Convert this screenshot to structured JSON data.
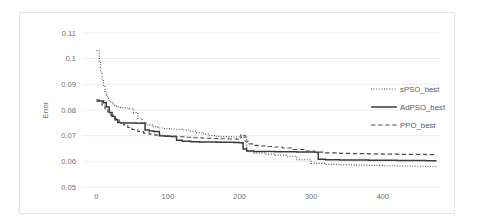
{
  "chart_data": {
    "type": "line",
    "title": "",
    "xlabel": "",
    "ylabel": "Error",
    "xlim": [
      -20,
      480
    ],
    "ylim": [
      0.05,
      0.11
    ],
    "xticks": [
      0,
      100,
      200,
      300,
      400
    ],
    "yticks": [
      0.05,
      0.06,
      0.07,
      0.08,
      0.09,
      0.1,
      0.11
    ],
    "ytick_labels": [
      "0.05",
      "0.06",
      "0.07",
      "0.08",
      "0.09",
      "0.1",
      "0.11"
    ],
    "xtick_labels": [
      "0",
      "100",
      "200",
      "300",
      "400"
    ],
    "grid": true,
    "grid_axis": "y",
    "legend_position": "right",
    "series": [
      {
        "name": "sPSO_best",
        "style": "dotted",
        "color": "#5d5d5d",
        "x": [
          0,
          2,
          4,
          6,
          8,
          10,
          12,
          14,
          16,
          18,
          20,
          24,
          28,
          32,
          36,
          40,
          46,
          52,
          58,
          64,
          70,
          78,
          86,
          94,
          102,
          110,
          120,
          130,
          140,
          150,
          158,
          165,
          172,
          180,
          190,
          200,
          210,
          220,
          235,
          250,
          265,
          280,
          300,
          320,
          340,
          360,
          380,
          400,
          420,
          440,
          460,
          475
        ],
        "y": [
          0.1032,
          0.1032,
          0.0985,
          0.0948,
          0.0915,
          0.0893,
          0.0872,
          0.0858,
          0.0845,
          0.0836,
          0.0829,
          0.0818,
          0.0812,
          0.081,
          0.0809,
          0.0808,
          0.0805,
          0.079,
          0.0768,
          0.0752,
          0.0742,
          0.0735,
          0.073,
          0.0728,
          0.0726,
          0.0725,
          0.0722,
          0.0718,
          0.0712,
          0.0706,
          0.07,
          0.0697,
          0.0696,
          0.0696,
          0.0695,
          0.0694,
          0.0638,
          0.0632,
          0.0628,
          0.0624,
          0.062,
          0.0606,
          0.0592,
          0.0588,
          0.0586,
          0.0585,
          0.0584,
          0.0583,
          0.0582,
          0.0581,
          0.058,
          0.058
        ]
      },
      {
        "name": "AdPSO_best",
        "style": "solid",
        "color": "#3a3a3a",
        "x": [
          0,
          5,
          10,
          14,
          18,
          22,
          26,
          30,
          34,
          38,
          42,
          46,
          50,
          56,
          62,
          68,
          74,
          80,
          88,
          96,
          104,
          112,
          120,
          132,
          144,
          156,
          168,
          180,
          192,
          200,
          205,
          210,
          220,
          235,
          250,
          265,
          280,
          295,
          305,
          310,
          320,
          340,
          360,
          380,
          400,
          420,
          440,
          460,
          475
        ],
        "y": [
          0.0835,
          0.0835,
          0.0828,
          0.0812,
          0.079,
          0.0775,
          0.0762,
          0.0751,
          0.0749,
          0.0749,
          0.0749,
          0.0749,
          0.0749,
          0.0748,
          0.0748,
          0.0722,
          0.0718,
          0.0716,
          0.07,
          0.0698,
          0.0697,
          0.0682,
          0.0678,
          0.0676,
          0.0675,
          0.0675,
          0.0674,
          0.0674,
          0.0673,
          0.0672,
          0.0648,
          0.064,
          0.0638,
          0.0638,
          0.0637,
          0.0637,
          0.0636,
          0.0636,
          0.0635,
          0.0608,
          0.0606,
          0.0605,
          0.0605,
          0.0604,
          0.0604,
          0.0603,
          0.0603,
          0.0602,
          0.0602
        ]
      },
      {
        "name": "PPO_best",
        "style": "dashed",
        "color": "#4f4f4f",
        "x": [
          0,
          4,
          8,
          12,
          16,
          20,
          26,
          32,
          38,
          44,
          50,
          58,
          66,
          74,
          82,
          90,
          100,
          112,
          124,
          136,
          148,
          160,
          172,
          184,
          196,
          202,
          206,
          208,
          212,
          218,
          226,
          236,
          248,
          260,
          275,
          290,
          305,
          320,
          340,
          360,
          380,
          400,
          420,
          440,
          460,
          475
        ],
        "y": [
          0.084,
          0.0832,
          0.0818,
          0.0805,
          0.0792,
          0.078,
          0.0766,
          0.0752,
          0.0742,
          0.0732,
          0.0724,
          0.0716,
          0.071,
          0.0706,
          0.0702,
          0.07,
          0.0698,
          0.0696,
          0.0694,
          0.0692,
          0.069,
          0.0689,
          0.0688,
          0.0687,
          0.0686,
          0.0704,
          0.07,
          0.0678,
          0.0668,
          0.0662,
          0.066,
          0.0658,
          0.0656,
          0.0652,
          0.0646,
          0.064,
          0.0636,
          0.0633,
          0.0631,
          0.063,
          0.0629,
          0.0628,
          0.0627,
          0.0627,
          0.0626,
          0.0626
        ]
      }
    ],
    "legend": [
      {
        "label": "sPSO_best",
        "style": "dotted"
      },
      {
        "label": "AdPSO_best",
        "style": "solid"
      },
      {
        "label": "PPO_best",
        "style": "dashed"
      }
    ]
  }
}
